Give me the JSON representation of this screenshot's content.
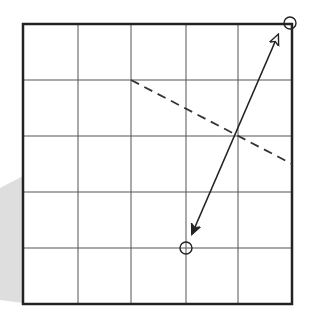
{
  "diagram": {
    "type": "grid-geometry",
    "grid": {
      "columns": 5,
      "rows": 5,
      "frame": {
        "x": 23,
        "y": 24,
        "width": 269,
        "height": 280
      },
      "column_lines_x": [
        23,
        78,
        131,
        186,
        238,
        292
      ],
      "row_lines_y": [
        24,
        80,
        136,
        192,
        248,
        304
      ],
      "frame_color": "#222222",
      "line_color": "#555555"
    },
    "shade": {
      "color": "#d8d8d8",
      "points": [
        [
          23,
          176
        ],
        [
          0,
          188
        ],
        [
          0,
          300
        ],
        [
          23,
          303
        ]
      ]
    },
    "dashed_line": {
      "from": [
        131,
        80
      ],
      "to": [
        292,
        164
      ],
      "color": "#333333"
    },
    "double_arrow": {
      "from": [
        192,
        234
      ],
      "to": [
        278,
        35
      ],
      "start_head": "filled",
      "end_head": "open",
      "color": "#222222"
    },
    "circles": [
      {
        "label": "corner-marker",
        "cx": 290,
        "cy": 23,
        "r": 6
      },
      {
        "label": "grid-point-marker",
        "cx": 186,
        "cy": 248,
        "r": 6
      }
    ]
  }
}
